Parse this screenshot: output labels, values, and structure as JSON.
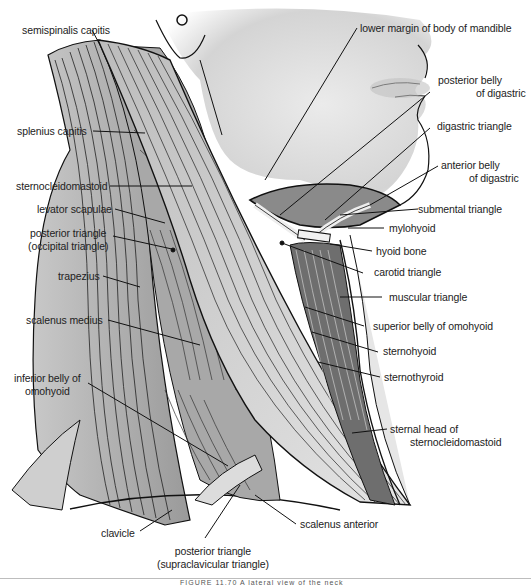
{
  "figure": {
    "caption_partial": "FIGURE 11.70  A lateral view of the neck"
  },
  "labels": {
    "semispinalis_capitis": "semispinalis capitis",
    "splenius_capitis": "splenius capitis",
    "sternocleidomastoid": "sternocleidomastoid",
    "levator_scapulae": "levator scapulae",
    "posterior_triangle_occipital_1": "posterior triangle",
    "posterior_triangle_occipital_2": "(occipital triangle)",
    "trapezius": "trapezius",
    "scalenus_medius": "scalenus medius",
    "inferior_belly_omohyoid_1": "inferior belly of",
    "inferior_belly_omohyoid_2": "omohyoid",
    "clavicle": "clavicle",
    "posterior_triangle_supraclavicular_1": "posterior triangle",
    "posterior_triangle_supraclavicular_2": "(supraclavicular triangle)",
    "scalenus_anterior": "scalenus anterior",
    "lower_margin_mandible": "lower margin of body of mandible",
    "posterior_belly_digastric_1": "posterior belly",
    "posterior_belly_digastric_2": "of digastric",
    "digastric_triangle": "digastric triangle",
    "anterior_belly_digastric_1": "anterior belly",
    "anterior_belly_digastric_2": "of digastric",
    "submental_triangle": "submental triangle",
    "mylohyoid": "mylohyoid",
    "hyoid_bone": "hyoid bone",
    "carotid_triangle": "carotid triangle",
    "muscular_triangle": "muscular triangle",
    "superior_belly_omohyoid": "superior belly of omohyoid",
    "sternohyoid": "sternohyoid",
    "sternothyroid": "sternothyroid",
    "sternal_head_scm_1": "sternal head of",
    "sternal_head_scm_2": "sternocleidomastoid"
  },
  "colors": {
    "skin": "#d6d6d6",
    "muscle_light": "#e8e8e8",
    "muscle_mid": "#b4b4b4",
    "muscle_dark": "#7a7a7a",
    "outline": "#111111",
    "text": "#222222"
  }
}
